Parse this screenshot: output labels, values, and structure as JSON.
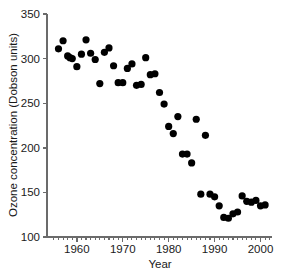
{
  "chart_data": {
    "type": "scatter",
    "title": "",
    "xlabel": "Year",
    "ylabel": "Ozone concentration (Dobson units)",
    "xlim": [
      1953.5,
      2002.5
    ],
    "ylim": [
      100,
      350
    ],
    "xticks": [
      1960,
      1970,
      1980,
      1990,
      2000
    ],
    "xtick_labels": [
      "1960",
      "1970",
      "1980",
      "1990",
      "2000"
    ],
    "x_minor_step": 1,
    "yticks": [
      100,
      150,
      200,
      250,
      300,
      350
    ],
    "ytick_labels": [
      "100",
      "150",
      "200",
      "250",
      "300",
      "350"
    ],
    "grid": false,
    "legend": "none",
    "marker": "filled-circle",
    "marker_color": "#000000",
    "marker_size_px": 5.4,
    "x": [
      1956,
      1957,
      1958,
      1958.5,
      1959,
      1960,
      1961,
      1962,
      1963,
      1964,
      1965,
      1966,
      1967,
      1968,
      1969,
      1970,
      1971,
      1972,
      1973,
      1974,
      1975,
      1976,
      1977,
      1978,
      1979,
      1980,
      1981,
      1982,
      1983,
      1984,
      1985,
      1986,
      1987,
      1988,
      1989,
      1990,
      1991,
      1992,
      1993,
      1994,
      1995,
      1996,
      1997,
      1998,
      1999,
      2000,
      2001
    ],
    "y": [
      311,
      320,
      303,
      301,
      300,
      291,
      305,
      321,
      306,
      299,
      272,
      307,
      312,
      292,
      273,
      273,
      289,
      294,
      270,
      271,
      301,
      282,
      283,
      262,
      249,
      224,
      216,
      235,
      193,
      193,
      183,
      232,
      148,
      214,
      148,
      145,
      135,
      122,
      121,
      126,
      128,
      146,
      140,
      139,
      141,
      135,
      136
    ],
    "series_name": "Antarctic ozone concentration",
    "n_points": 47
  },
  "axis": {
    "y_title": "Ozone concentration (Dobson units)",
    "x_title": "Year"
  }
}
